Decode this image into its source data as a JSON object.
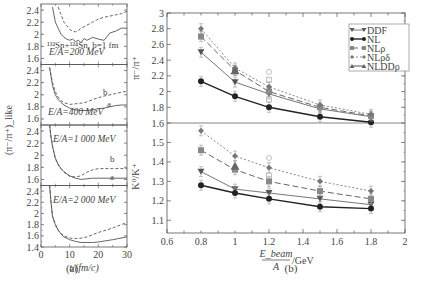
{
  "figure": {
    "label_a": "(a)",
    "label_b": "(b)"
  },
  "chart_data": [
    {
      "type": "line",
      "id": "a",
      "panel_label": "(a)",
      "title": "",
      "xlabel": "t/(fm/c)",
      "ylabel": "(π⁻/π⁺)_like",
      "xlim": [
        0,
        30
      ],
      "x_ticks": [
        "0",
        "10",
        "20",
        "30"
      ],
      "annotation_reaction": "¹³²Sn+¹²⁴Sn, b=1 fm",
      "curve_labels": [
        "a",
        "b"
      ],
      "subpanels": [
        {
          "label": "E/A=200 MeV",
          "ylim": [
            1.5,
            2.5
          ],
          "y_ticks": [
            "1.6",
            "1.8",
            "2",
            "2.2",
            "2.4"
          ],
          "series": [
            {
              "name": "a",
              "style": "solid",
              "x": [
                4,
                5,
                6,
                7,
                8,
                9,
                10,
                11,
                12,
                13,
                14,
                15,
                16,
                18,
                20,
                22,
                24,
                26,
                28,
                30
              ],
              "values": [
                2.45,
                2.2,
                2.1,
                2.0,
                1.95,
                1.92,
                1.9,
                1.92,
                1.88,
                1.9,
                1.86,
                1.93,
                1.9,
                1.95,
                1.92,
                1.9,
                2.02,
                2.05,
                2.1,
                2.1
              ]
            },
            {
              "name": "b",
              "style": "dashed",
              "x": [
                6,
                8,
                10,
                11,
                12,
                13,
                14,
                16,
                18,
                20,
                22,
                24,
                26,
                28,
                30
              ],
              "values": [
                2.45,
                2.2,
                2.08,
                2.05,
                2.04,
                2.06,
                2.1,
                2.15,
                2.2,
                2.25,
                2.28,
                2.3,
                2.32,
                2.34,
                2.38
              ]
            }
          ]
        },
        {
          "label": "E/A=400 MeV",
          "ylim": [
            1.5,
            2.5
          ],
          "y_ticks": [
            "1.6",
            "1.8",
            "2",
            "2.2",
            "2.4"
          ],
          "series": [
            {
              "name": "a",
              "style": "solid",
              "x": [
                3,
                4,
                5,
                6,
                7,
                8,
                10,
                12,
                14,
                16,
                18,
                20,
                22,
                24,
                26,
                28,
                30
              ],
              "values": [
                2.45,
                2.15,
                2.0,
                1.92,
                1.87,
                1.83,
                1.78,
                1.75,
                1.74,
                1.74,
                1.75,
                1.77,
                1.78,
                1.8,
                1.82,
                1.83,
                1.83
              ]
            },
            {
              "name": "b",
              "style": "dashed",
              "x": [
                3,
                4,
                5,
                6,
                7,
                8,
                10,
                12,
                14,
                16,
                18,
                20,
                22,
                24,
                26,
                28,
                30
              ],
              "values": [
                2.45,
                2.2,
                2.05,
                1.96,
                1.9,
                1.87,
                1.84,
                1.85,
                1.86,
                1.88,
                1.92,
                1.95,
                1.98,
                2.0,
                2.02,
                2.04,
                2.06
              ]
            }
          ]
        },
        {
          "label": "E/A=1 000 MeV",
          "ylim": [
            1.5,
            2.5
          ],
          "y_ticks": [
            "1.6",
            "1.8",
            "2",
            "2.2",
            "2.4"
          ],
          "series": [
            {
              "name": "a",
              "style": "solid",
              "x": [
                3,
                3.5,
                4,
                5,
                6,
                7,
                8,
                10,
                12,
                14,
                16,
                18,
                20,
                25,
                30
              ],
              "values": [
                2.5,
                2.3,
                2.15,
                1.95,
                1.85,
                1.78,
                1.73,
                1.66,
                1.62,
                1.6,
                1.61,
                1.62,
                1.62,
                1.62,
                1.62
              ]
            },
            {
              "name": "b",
              "style": "dashed",
              "x": [
                3,
                3.5,
                4,
                5,
                6,
                7,
                8,
                10,
                12,
                14,
                16,
                18,
                20,
                25,
                30
              ],
              "values": [
                2.5,
                2.3,
                2.15,
                1.95,
                1.84,
                1.77,
                1.72,
                1.65,
                1.64,
                1.66,
                1.72,
                1.76,
                1.78,
                1.78,
                1.78
              ]
            }
          ]
        },
        {
          "label": "E/A=2 000 MeV",
          "ylim": [
            1.4,
            2.5
          ],
          "y_ticks": [
            "1.4",
            "1.6",
            "1.8",
            "2",
            "2.2",
            "2.4"
          ],
          "series": [
            {
              "name": "a",
              "style": "solid",
              "x": [
                3,
                3.5,
                4,
                5,
                6,
                7,
                8,
                10,
                12,
                14,
                16,
                18,
                20,
                25,
                30
              ],
              "values": [
                2.5,
                2.2,
                1.95,
                1.8,
                1.7,
                1.63,
                1.58,
                1.53,
                1.5,
                1.48,
                1.48,
                1.48,
                1.49,
                1.53,
                1.58
              ]
            },
            {
              "name": "b",
              "style": "dashed",
              "x": [
                3,
                3.5,
                4,
                5,
                6,
                7,
                8,
                10,
                12,
                14,
                16,
                18,
                20,
                25,
                30
              ],
              "values": [
                2.5,
                2.2,
                1.95,
                1.8,
                1.7,
                1.64,
                1.6,
                1.56,
                1.55,
                1.56,
                1.58,
                1.62,
                1.66,
                1.74,
                1.84
              ]
            }
          ]
        }
      ]
    },
    {
      "type": "line",
      "id": "b",
      "panel_label": "(b)",
      "title": "",
      "xlabel_num": "E_beam",
      "xlabel_den": "A",
      "xlabel_unit": "/GeV",
      "xlim": [
        0.6,
        2.0
      ],
      "x_ticks": [
        "0.6",
        "0.8",
        "1",
        "1.2",
        "1.4",
        "1.6",
        "1.8",
        "2"
      ],
      "legend": {
        "position": "upper right",
        "entries": [
          "DDF",
          "NL",
          "NLρ",
          "NLρδ",
          "NLDDρ"
        ]
      },
      "categories": [
        0.8,
        1.0,
        1.2,
        1.5,
        1.8
      ],
      "upper": {
        "ylabel": "π⁻/π⁺",
        "ylim": [
          1.6,
          3.0
        ],
        "y_ticks": [
          "1.6",
          "1.8",
          "2",
          "2.2",
          "2.4",
          "2.6",
          "2.8",
          "3"
        ],
        "series": [
          {
            "name": "DDF",
            "values": [
              2.5,
              2.12,
              1.97,
              1.78,
              1.68
            ]
          },
          {
            "name": "NL",
            "values": [
              2.13,
              1.94,
              1.8,
              1.68,
              1.61
            ]
          },
          {
            "name": "NLρ",
            "values": [
              2.7,
              2.27,
              2.0,
              1.8,
              1.69
            ]
          },
          {
            "name": "NLρδ",
            "values": [
              2.8,
              2.3,
              2.06,
              1.83,
              1.71
            ]
          },
          {
            "name": "NLDDρ",
            "values": [
              null,
              2.27,
              null,
              null,
              null
            ]
          }
        ],
        "open_markers_at_1_2": [
          2.25,
          2.15,
          1.9
        ]
      },
      "lower": {
        "ylabel": "K⁰/K⁺",
        "ylim": [
          1.05,
          1.6
        ],
        "y_ticks": [
          "1.1",
          "1.2",
          "1.3",
          "1.4",
          "1.5"
        ],
        "series": [
          {
            "name": "DDF",
            "values": [
              1.35,
              1.26,
              1.24,
              1.21,
              1.18
            ]
          },
          {
            "name": "NL",
            "values": [
              1.28,
              1.24,
              1.21,
              1.17,
              1.16
            ]
          },
          {
            "name": "NLρ",
            "values": [
              1.46,
              1.36,
              1.3,
              1.25,
              1.21
            ]
          },
          {
            "name": "NLρδ",
            "values": [
              1.56,
              1.43,
              1.37,
              1.3,
              1.25
            ]
          },
          {
            "name": "NLDDρ",
            "values": [
              null,
              1.38,
              null,
              null,
              null
            ]
          }
        ],
        "open_markers_at_1_2": [
          1.42,
          1.33
        ]
      }
    }
  ]
}
